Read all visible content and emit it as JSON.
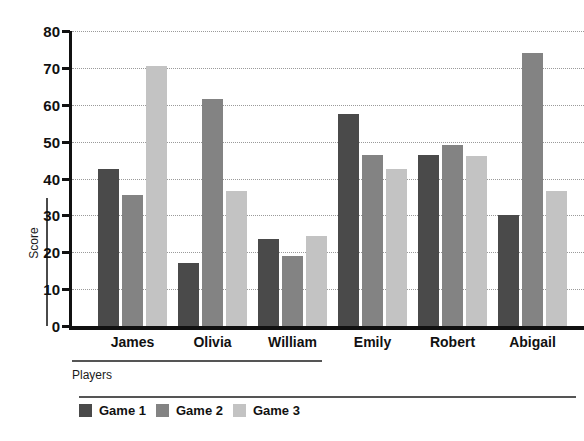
{
  "chart_data": {
    "type": "bar",
    "title": "",
    "xlabel": "Players",
    "ylabel": "Score",
    "categories": [
      "James",
      "Olivia",
      "William",
      "Emily",
      "Robert",
      "Abigail"
    ],
    "series": [
      {
        "name": "Game 1",
        "color": "#4a4a4a",
        "values": [
          42.5,
          17,
          23.5,
          57.5,
          46.5,
          30
        ]
      },
      {
        "name": "Game 2",
        "color": "#838383",
        "values": [
          35.5,
          61.5,
          19,
          46.5,
          49,
          74
        ]
      },
      {
        "name": "Game 3",
        "color": "#c3c3c3",
        "values": [
          70.5,
          36.5,
          24.5,
          42.5,
          46,
          36.5
        ]
      }
    ],
    "ylim": [
      0,
      80
    ],
    "yticks": [
      0,
      10,
      20,
      30,
      40,
      50,
      60,
      70,
      80
    ],
    "ytick_labels": [
      "0",
      "10",
      "20",
      "30",
      "40",
      "50",
      "60",
      "70",
      "80"
    ],
    "grid": true,
    "grid_style": "dotted",
    "legend_position": "bottom-left",
    "background": "#ffffff",
    "axis_color": "#111111"
  }
}
